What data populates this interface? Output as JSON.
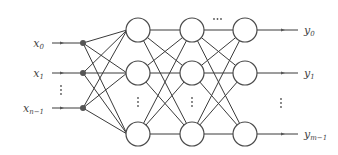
{
  "diagram": {
    "type": "feedforward-neural-network",
    "inputs": [
      {
        "label": "x",
        "sub": "0",
        "y": 43
      },
      {
        "label": "x",
        "sub": "1",
        "y": 73
      },
      {
        "label": "x",
        "sub": "n−1",
        "y": 108
      }
    ],
    "input_ellipsis": "⋮",
    "outputs": [
      {
        "label": "y",
        "sub": "0",
        "y": 30
      },
      {
        "label": "y",
        "sub": "1",
        "y": 73
      },
      {
        "label": "y",
        "sub": "m−1",
        "y": 134
      }
    ],
    "output_ellipsis": "⋮",
    "hidden_layers": [
      {
        "x": 138,
        "rows": [
          30,
          73,
          134
        ]
      },
      {
        "x": 192,
        "rows": [
          30,
          73,
          134
        ]
      },
      {
        "x": 245,
        "rows": [
          30,
          73,
          134
        ]
      }
    ],
    "layer_gap_ellipsis": "···",
    "colors": {
      "line": "#3a3a3a",
      "node_stroke": "#4a4a4a",
      "dot": "#555555",
      "text": "#444444"
    }
  }
}
